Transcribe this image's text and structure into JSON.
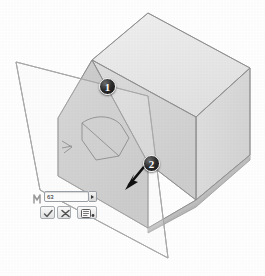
{
  "app": {
    "view_label": "3D model viewport",
    "background_color": "#ffffff"
  },
  "model": {
    "name": "chamfered-block-solid",
    "colors": {
      "top_face": "#e9e9e9",
      "front_face": "#c9c9c9",
      "right_face": "#dcdcdc",
      "chamfer_face": "#d6d6d6",
      "bottom_face": "#bdbdbd",
      "edge": "#8e8e8e",
      "sketch_line": "#6f6f6f",
      "plane_edge": "#b0b0b0",
      "plane_fill": "#fbfbfb"
    },
    "sketch_profile_label": "cone sketch profile",
    "reference_plane_label": "reference plane"
  },
  "callouts": [
    {
      "id": "callout-1",
      "label": "1"
    },
    {
      "id": "callout-2",
      "label": "2"
    }
  ],
  "direction_arrow": {
    "label": "extrude direction arrow",
    "color": "#111111"
  },
  "popup": {
    "name": "value-property-popup",
    "lead_icon": "dimension-icon",
    "value": "63",
    "placeholder": "63",
    "spin_icon": "chevron-right-icon",
    "buttons": [
      {
        "id": "ok-button",
        "icon": "check-icon",
        "label": "OK"
      },
      {
        "id": "cancel-button",
        "icon": "x-icon",
        "label": "Cancel"
      },
      {
        "id": "options-button",
        "icon": "list-icon",
        "label": "Options"
      }
    ]
  }
}
